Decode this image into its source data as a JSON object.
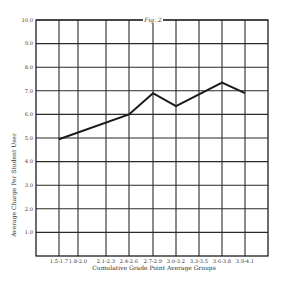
{
  "chart_data": {
    "type": "line",
    "title": "Fig. 2",
    "xlabel": "Cumulative Grade Point Average Groups",
    "ylabel": "Average Charge Per Student User",
    "categories": [
      "1.5-1.7",
      "1.8-2.0",
      "2.1-2.3",
      "2.4-2.6",
      "2.7-2.9",
      "3.0-3.2",
      "3.3-3.5",
      "3.6-3.8",
      "3.9-4.1"
    ],
    "series": [
      {
        "name": "Average Charge",
        "points": [
          {
            "x": "1.5-1.7",
            "y": 4.95
          },
          {
            "x": "2.4-2.6",
            "y": 6.0
          },
          {
            "x": "2.7-2.9",
            "y": 6.9
          },
          {
            "x": "3.0-3.2",
            "y": 6.35
          },
          {
            "x": "3.6-3.8",
            "y": 7.35
          },
          {
            "x": "3.9-4.1",
            "y": 6.9
          }
        ]
      }
    ],
    "yticks": [
      "1.0",
      "2.0",
      "3.0",
      "4.0",
      "5.0",
      "6.0",
      "7.0",
      "8.0",
      "9.0",
      "10.0"
    ],
    "ylim": [
      0,
      10
    ],
    "grid": true,
    "legend": "none"
  },
  "layout": {
    "plot": {
      "left": 36,
      "top": 20,
      "right": 268,
      "bottom": 256
    },
    "vertical_gridlines_x": [
      59,
      78,
      106,
      129,
      153,
      176,
      199,
      222,
      245
    ],
    "category_x": {
      "1.5-1.7": 59,
      "1.8-2.0": 78,
      "2.1-2.3": 106,
      "2.4-2.6": 129,
      "2.7-2.9": 153,
      "3.0-3.2": 176,
      "3.3-3.5": 199,
      "3.6-3.8": 222,
      "3.9-4.1": 245
    }
  }
}
